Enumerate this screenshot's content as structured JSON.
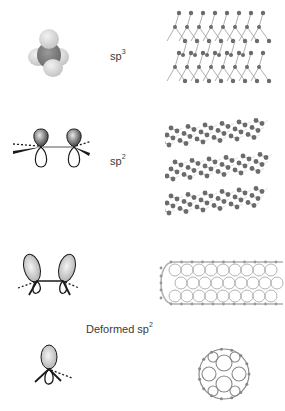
{
  "diagram": {
    "rows": [
      {
        "id": "sp3",
        "label_base": "sp",
        "label_sup": "3",
        "orbital": "tetrahedral-orbital",
        "structure": "diamond-lattice"
      },
      {
        "id": "sp2",
        "label_base": "sp",
        "label_sup": "2",
        "orbital": "planar-p-orbitals",
        "structure": "graphite-layers"
      },
      {
        "id": "deformed-sp2-nanotube",
        "orbital": "bent-p-orbitals",
        "structure": "carbon-nanotube"
      },
      {
        "id": "deformed-sp2-fullerene",
        "orbital": "pyramidalized-orbital",
        "structure": "fullerene-c60"
      }
    ],
    "deformed_label_base": "Deformed sp",
    "deformed_label_sup": "2"
  },
  "colors": {
    "atom": "#6b6b6b",
    "bond": "#9a9a9a",
    "orbital_dark": "#555555",
    "orbital_light": "#dcdcdc",
    "outline": "#1a1a1a",
    "text": "#3a3a3a"
  }
}
